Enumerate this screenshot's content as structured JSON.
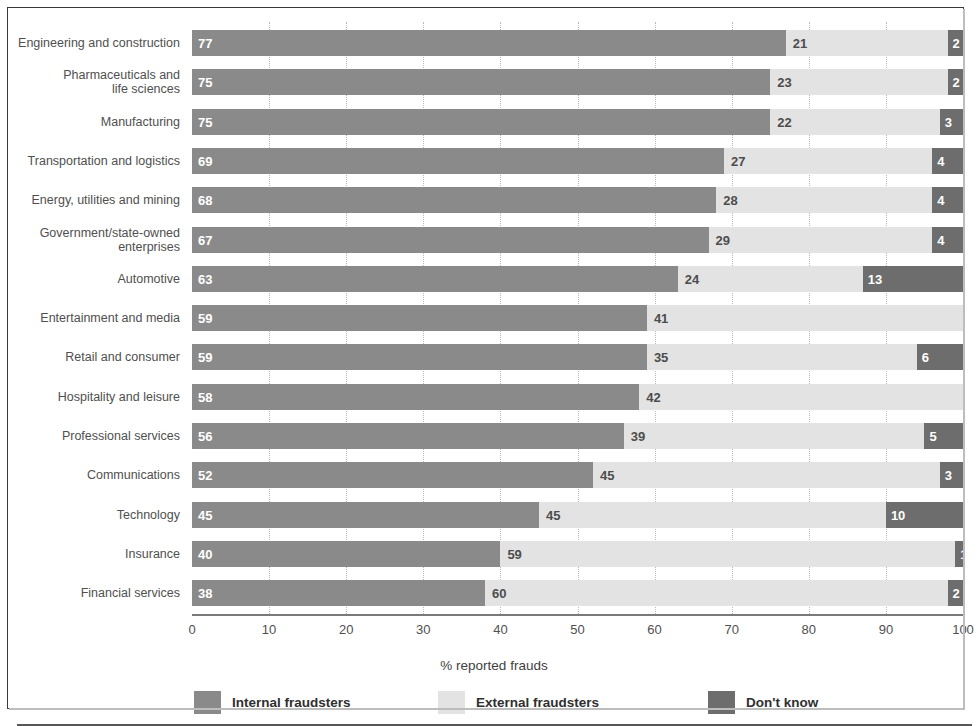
{
  "chart_data": {
    "type": "bar",
    "subtype": "stacked-horizontal-bar",
    "title": "",
    "subtitle": "",
    "xlabel": "% reported frauds",
    "ylabel": "",
    "xlim": [
      0,
      100
    ],
    "xticks": [
      0,
      10,
      20,
      30,
      40,
      50,
      60,
      70,
      80,
      90,
      100
    ],
    "xtick_labels": [
      "0",
      "10",
      "20",
      "30",
      "40",
      "50",
      "60",
      "70",
      "80",
      "90",
      "100"
    ],
    "grid": "vertical-dotted",
    "legend_position": "bottom",
    "stack_order": [
      "Internal fraudsters",
      "External fraudsters",
      "Don't know"
    ],
    "categories": [
      "Engineering and construction",
      "Pharmaceuticals and\nlife sciences",
      "Manufacturing",
      "Transportation and logistics",
      "Energy, utilities and mining",
      "Government/state-owned\nenterprises",
      "Automotive",
      "Entertainment and media",
      "Retail and consumer",
      "Hospitality and leisure",
      "Professional services",
      "Communications",
      "Technology",
      "Insurance",
      "Financial services"
    ],
    "series": [
      {
        "name": "Internal fraudsters",
        "color": "#8a8a8a",
        "values": [
          77,
          75,
          75,
          69,
          68,
          67,
          63,
          59,
          59,
          58,
          56,
          52,
          45,
          40,
          38
        ]
      },
      {
        "name": "External fraudsters",
        "color": "#e3e3e3",
        "values": [
          21,
          23,
          22,
          27,
          28,
          29,
          24,
          41,
          35,
          42,
          39,
          45,
          45,
          59,
          60
        ]
      },
      {
        "name": "Don't know",
        "color": "#6d6d6d",
        "values": [
          2,
          2,
          3,
          4,
          4,
          4,
          13,
          0,
          6,
          0,
          5,
          3,
          10,
          1,
          2
        ]
      }
    ]
  },
  "legend": {
    "items": [
      {
        "label": "Internal fraudsters",
        "swatch": "internal"
      },
      {
        "label": "External fraudsters",
        "swatch": "external"
      },
      {
        "label": "Don't know",
        "swatch": "dk"
      }
    ]
  }
}
